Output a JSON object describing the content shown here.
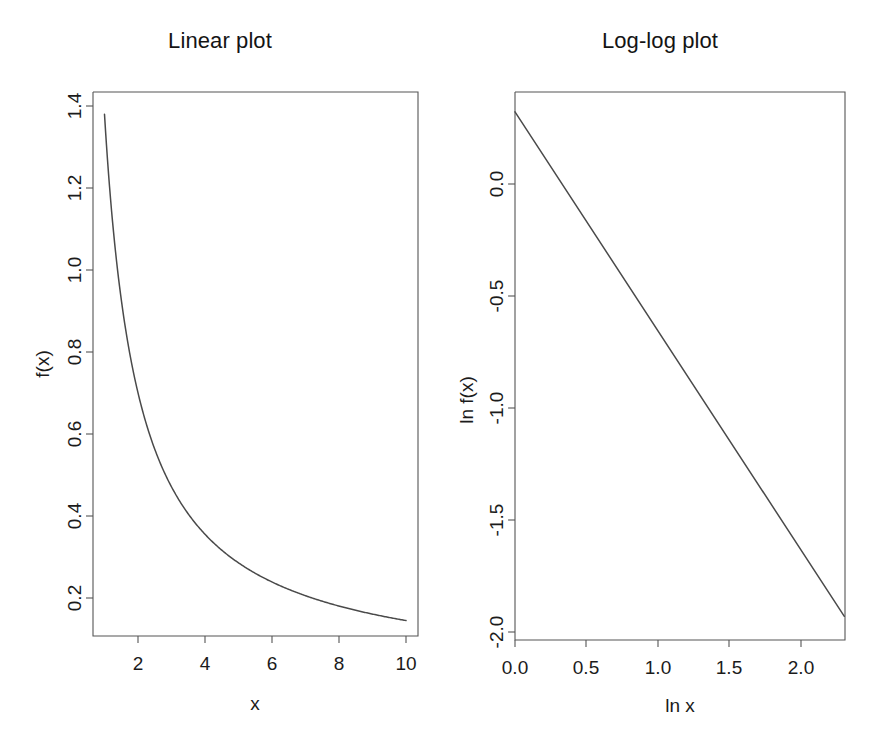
{
  "figure": {
    "background": "#ffffff",
    "foreground": "#1a1a1a",
    "axis_color": "#555555",
    "curve_color": "#4a4a4a",
    "width": 880,
    "height": 734,
    "panels": 2
  },
  "panel_linear": {
    "title": "Linear plot",
    "xlabel": "x",
    "ylabel": "f(x)",
    "xticks": [
      "2",
      "4",
      "6",
      "8",
      "10"
    ],
    "yticks": [
      "0.2",
      "0.4",
      "0.6",
      "0.8",
      "1.0",
      "1.2",
      "1.4"
    ]
  },
  "panel_loglog": {
    "title": "Log-log plot",
    "xlabel": "ln x",
    "ylabel": "ln f(x)",
    "xticks": [
      "0.0",
      "0.5",
      "1.0",
      "1.5",
      "2.0"
    ],
    "yticks": [
      "-2.0",
      "-1.5",
      "-1.0",
      "-0.5",
      "0.0"
    ]
  },
  "chart_data": [
    {
      "type": "line",
      "id": "linear",
      "title": "Linear plot",
      "xlabel": "x",
      "ylabel": "f(x)",
      "xlim": [
        0.64,
        10.36
      ],
      "ylim": [
        0.105,
        1.425
      ],
      "xticks": [
        2,
        4,
        6,
        8,
        10
      ],
      "yticks": [
        0.2,
        0.4,
        0.6,
        0.8,
        1.0,
        1.2,
        1.4
      ],
      "grid": false,
      "legend": false,
      "equation": "f(x) = 1.38 * x^-0.978",
      "x": [
        1.0,
        1.25,
        1.5,
        1.75,
        2.0,
        2.25,
        2.5,
        2.75,
        3.0,
        3.5,
        4.0,
        4.5,
        5.0,
        5.5,
        6.0,
        6.5,
        7.0,
        7.5,
        8.0,
        8.5,
        9.0,
        9.5,
        10.0
      ],
      "y": [
        1.38,
        1.112,
        0.931,
        0.803,
        0.703,
        0.627,
        0.566,
        0.516,
        0.474,
        0.409,
        0.358,
        0.32,
        0.288,
        0.263,
        0.242,
        0.224,
        0.208,
        0.195,
        0.183,
        0.173,
        0.164,
        0.156,
        0.145
      ]
    },
    {
      "type": "line",
      "id": "loglog",
      "title": "Log-log plot",
      "xlabel": "ln x",
      "ylabel": "ln f(x)",
      "xlim": [
        -0.07,
        2.44
      ],
      "ylim": [
        -2.05,
        0.38
      ],
      "xticks": [
        0.0,
        0.5,
        1.0,
        1.5,
        2.0
      ],
      "yticks": [
        -2.0,
        -1.5,
        -1.0,
        -0.5,
        0.0
      ],
      "grid": false,
      "legend": false,
      "equation": "ln f(x) = 0.322 - 0.978 * ln x",
      "x": [
        0.0,
        2.303
      ],
      "y": [
        0.322,
        -1.93
      ]
    }
  ]
}
